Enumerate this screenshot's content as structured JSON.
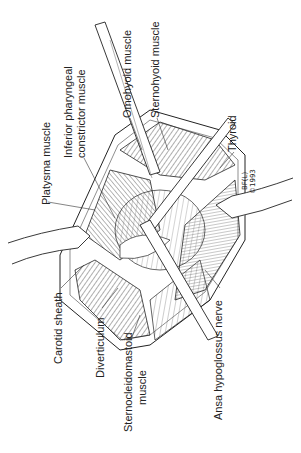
{
  "figure": {
    "type": "surgical illustration",
    "orientation": "rotated 90 degrees counter-clockwise",
    "labels": {
      "platysma": "Platysma muscle",
      "inferior_pharyngeal_line1": "Inferior pharyngeal",
      "inferior_pharyngeal_line2": "constrictor muscle",
      "omohyoid": "Omohyoid muscle",
      "sternohyoid": "Sternohyoid muscle",
      "thyroid": "Thyroid",
      "carotid_sheath": "Carotid sheath",
      "diverticulum": "Diverticulum",
      "sternocleidomastoid_line1": "Sternocleidomastoid",
      "sternocleidomastoid_line2": "muscle",
      "ansa_hypoglossus": "Ansa hypoglossus nerve"
    },
    "signature": {
      "line1": "BF(L)",
      "line2": "©1993"
    },
    "colors": {
      "ink": "#222222",
      "background": "#ffffff"
    }
  }
}
